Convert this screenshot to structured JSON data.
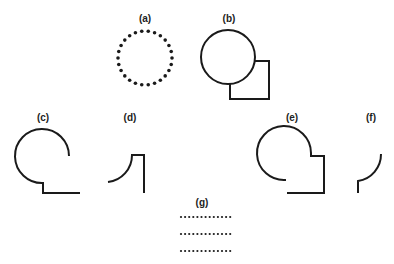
{
  "figure": {
    "panels": [
      {
        "id": "a",
        "label": "(a)",
        "description": "dotted circle"
      },
      {
        "id": "b",
        "label": "(b)",
        "description": "circle overlapping square"
      },
      {
        "id": "c",
        "label": "(c)",
        "description": "open circle arc joined to step line"
      },
      {
        "id": "d",
        "label": "(d)",
        "description": "concave arc fragment with corner line"
      },
      {
        "id": "e",
        "label": "(e)",
        "description": "circle arc merged with square corner"
      },
      {
        "id": "f",
        "label": "(f)",
        "description": "small arc fragment"
      },
      {
        "id": "g",
        "label": "(g)",
        "description": "three rows of dots"
      }
    ],
    "colors": {
      "ink": "#1a1a1a",
      "background": "#ffffff"
    }
  }
}
